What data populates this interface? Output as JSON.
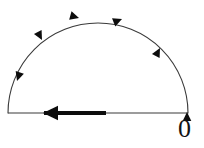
{
  "figure": {
    "kind": "contour-diagram",
    "width": 204,
    "height": 148,
    "background_color": "#ffffff",
    "stroke_color": "#3a3a3a",
    "arrow_color": "#0d0d0d",
    "labels": {
      "origin": "0"
    },
    "geometry": {
      "center_x": 98,
      "center_y": 113,
      "radius": 90,
      "baseline_y": 113,
      "baseline_x_start": 8,
      "baseline_x_end": 188,
      "arc_stroke_width": 1.1,
      "baseline_stroke_width": 1.1,
      "bold_segment": {
        "x_start": 44,
        "x_end": 106,
        "y": 113,
        "stroke_width": 4.2
      }
    },
    "arrowheads": [
      {
        "name": "arc-arrow-lower-left",
        "x": 17,
        "y": 81,
        "angle": 108,
        "size": 9
      },
      {
        "name": "arc-arrow-upper-left",
        "x": 42,
        "y": 40,
        "angle": 62,
        "size": 9
      },
      {
        "name": "arc-arrow-top-left",
        "x": 79,
        "y": 18,
        "angle": 16,
        "size": 9
      },
      {
        "name": "arc-arrow-top-right",
        "x": 122,
        "y": 19,
        "angle": -22,
        "size": 9
      },
      {
        "name": "arc-arrow-lower-right",
        "x": 160,
        "y": 48,
        "angle": -62,
        "size": 9
      },
      {
        "name": "axis-arrow-right-end",
        "x": 187,
        "y": 112,
        "angle": -90,
        "size": 9
      },
      {
        "name": "axis-arrow-bold-left",
        "x": 43,
        "y": 113,
        "angle": 180,
        "size": 15
      }
    ]
  }
}
